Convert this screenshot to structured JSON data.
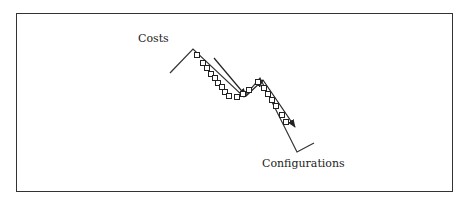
{
  "diagram": {
    "type": "cost-landscape-search",
    "labels": {
      "y_axis_label": "Costs",
      "x_axis_label": "Configurations"
    },
    "colors": {
      "line": "#333333",
      "marker_fill": "#ffffff",
      "frame": "#333333"
    },
    "cost_curve": [
      [
        170,
        73
      ],
      [
        193,
        49
      ],
      [
        244,
        97
      ],
      [
        260,
        78
      ],
      [
        297,
        152
      ],
      [
        314,
        143
      ]
    ],
    "search_markers": [
      [
        197,
        55
      ],
      [
        203,
        63
      ],
      [
        207,
        68
      ],
      [
        211,
        74
      ],
      [
        215,
        78
      ],
      [
        218,
        83
      ],
      [
        222,
        87
      ],
      [
        225,
        92
      ],
      [
        229,
        96
      ],
      [
        237,
        97
      ],
      [
        243,
        94
      ],
      [
        249,
        90
      ],
      [
        258,
        82
      ],
      [
        264,
        88
      ],
      [
        268,
        94
      ],
      [
        272,
        100
      ],
      [
        276,
        106
      ],
      [
        282,
        115
      ],
      [
        286,
        122
      ]
    ],
    "search_direction_arrows": [
      {
        "from": [
          214,
          58
        ],
        "to": [
          246,
          96
        ]
      },
      {
        "from": [
          246,
          96
        ],
        "to": [
          263,
          80
        ]
      },
      {
        "from": [
          263,
          80
        ],
        "to": [
          295,
          127
        ]
      }
    ]
  }
}
